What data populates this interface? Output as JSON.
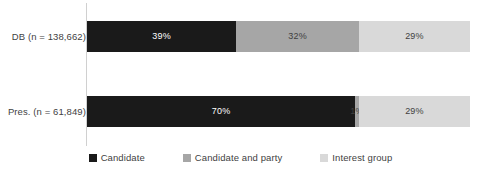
{
  "chart_data": {
    "type": "bar",
    "orientation": "horizontal",
    "stacked": true,
    "normalized": "percent",
    "title": "",
    "subtitle": "",
    "xlabel": "",
    "ylabel": "",
    "xlim": [
      0,
      100
    ],
    "grid": false,
    "legend_position": "bottom",
    "categories": [
      "DB (n = 138,662)",
      "Pres. (n = 61,849)"
    ],
    "series": [
      {
        "name": "Candidate",
        "color": "#1a1a1a",
        "values": [
          39,
          70
        ],
        "labels": [
          "39%",
          "70%"
        ]
      },
      {
        "name": "Candidate and party",
        "color": "#a6a6a6",
        "values": [
          32,
          1
        ],
        "labels": [
          "32%",
          "1%"
        ]
      },
      {
        "name": "Interest group",
        "color": "#d9d9d9",
        "values": [
          29,
          29
        ],
        "labels": [
          "29%",
          "29%"
        ]
      }
    ],
    "bars": [
      {
        "category": "DB (n = 138,662)",
        "segments": [
          {
            "series": "Candidate",
            "value": 39,
            "label": "39%",
            "color": "#1a1a1a",
            "label_color": "light"
          },
          {
            "series": "Candidate and party",
            "value": 32,
            "label": "32%",
            "color": "#a6a6a6",
            "label_color": "dark"
          },
          {
            "series": "Interest group",
            "value": 29,
            "label": "29%",
            "color": "#d9d9d9",
            "label_color": "dark"
          }
        ]
      },
      {
        "category": "Pres. (n = 61,849)",
        "segments": [
          {
            "series": "Candidate",
            "value": 70,
            "label": "70%",
            "color": "#1a1a1a",
            "label_color": "light"
          },
          {
            "series": "Candidate and party",
            "value": 1,
            "label": "1%",
            "color": "#a6a6a6",
            "label_color": "dark"
          },
          {
            "series": "Interest group",
            "value": 29,
            "label": "29%",
            "color": "#d9d9d9",
            "label_color": "dark"
          }
        ]
      }
    ],
    "legend": [
      {
        "label": "Candidate",
        "color": "#1a1a1a"
      },
      {
        "label": "Candidate and party",
        "color": "#a6a6a6"
      },
      {
        "label": "Interest group",
        "color": "#d9d9d9"
      }
    ],
    "colors": {
      "candidate": "#1a1a1a",
      "candidate_and_party": "#a6a6a6",
      "interest_group": "#d9d9d9",
      "axis_line": "#d0d0d0",
      "text": "#3f3f3f",
      "background": "#ffffff"
    }
  }
}
